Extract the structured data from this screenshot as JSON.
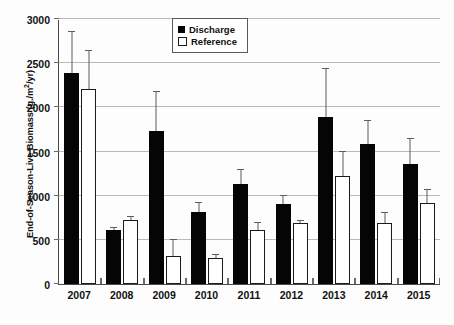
{
  "chart_data": {
    "type": "bar",
    "title": "",
    "xlabel": "",
    "ylabel": "End-of-Season-Live Biomass (g./m2/yr)",
    "ylabel_prefix": "End-of-Season-Live Biomass (g./m",
    "ylabel_sup": "2",
    "ylabel_suffix": "/yr)",
    "ylim": [
      0,
      3000
    ],
    "ytick_labels": [
      "0",
      "500",
      "1000",
      "1500",
      "2000",
      "2500",
      "3000"
    ],
    "ytick_values": [
      0,
      500,
      1000,
      1500,
      2000,
      2500,
      3000
    ],
    "grid": true,
    "legend_position": "top-center",
    "categories": [
      "2007",
      "2008",
      "2009",
      "2010",
      "2011",
      "2012",
      "2013",
      "2014",
      "2015"
    ],
    "series": [
      {
        "name": "Discharge",
        "color": "#050505",
        "style": "filled",
        "values": [
          2390,
          610,
          1730,
          810,
          1130,
          910,
          1890,
          1580,
          1360
        ],
        "error_upper": [
          2870,
          650,
          2190,
          930,
          1300,
          1010,
          2450,
          1860,
          1650
        ]
      },
      {
        "name": "Reference",
        "color": "#ffffff",
        "style": "open",
        "values": [
          2210,
          725,
          320,
          295,
          610,
          690,
          1220,
          690,
          920
        ],
        "error_upper": [
          2650,
          770,
          510,
          335,
          700,
          730,
          1510,
          810,
          1070
        ]
      }
    ]
  },
  "legend": {
    "items": [
      {
        "label": "Discharge",
        "style": "filled"
      },
      {
        "label": "Reference",
        "style": "open"
      }
    ]
  }
}
